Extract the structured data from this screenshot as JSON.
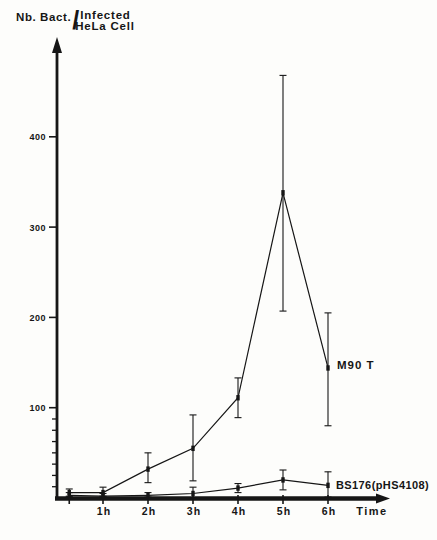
{
  "figure": {
    "background": "#fdfdfb",
    "ink": "#161616",
    "ylabel_parts": {
      "prefix": "Nb. Bact.",
      "slash": "/",
      "line1": "Infected",
      "line2": "HeLa Cell"
    }
  },
  "chart_data": {
    "type": "line",
    "xlabel": "Time",
    "ylabel": "Nb. Bact. / Infected HeLa Cell",
    "xlim": [
      0,
      7.4
    ],
    "ylim": [
      0,
      510
    ],
    "grid": false,
    "legend_position": "labels-at-line-ends",
    "x_ticks": [
      {
        "value": 0.25,
        "label": ""
      },
      {
        "value": 1,
        "label": "1h"
      },
      {
        "value": 2,
        "label": "2h"
      },
      {
        "value": 3,
        "label": "3h"
      },
      {
        "value": 4,
        "label": "4h"
      },
      {
        "value": 5,
        "label": "5h"
      },
      {
        "value": 6,
        "label": "6h"
      }
    ],
    "y_ticks": [
      {
        "value": 100,
        "label": "100"
      },
      {
        "value": 200,
        "label": "200"
      },
      {
        "value": 300,
        "label": "300"
      },
      {
        "value": 400,
        "label": "400"
      }
    ],
    "y_minor_ticks": [
      12.5,
      25,
      37.5,
      50,
      62.5,
      75,
      87.5
    ],
    "series": [
      {
        "name": "M90 T",
        "x": [
          0.25,
          1,
          2,
          3,
          4,
          5,
          6
        ],
        "y": [
          6,
          6,
          32,
          55,
          111,
          338,
          144
        ],
        "err_low": [
          2,
          2,
          17,
          19,
          89,
          207,
          80
        ],
        "err_high": [
          10,
          12,
          50,
          92,
          133,
          468,
          205
        ]
      },
      {
        "name": "BS176(pHS4108)",
        "x": [
          0.25,
          1,
          2,
          3,
          4,
          5,
          6
        ],
        "y": [
          3,
          2,
          3,
          5,
          11,
          20,
          14
        ],
        "err_low": [
          1,
          1,
          1,
          0,
          6,
          9,
          1
        ],
        "err_high": [
          6,
          5,
          6,
          12,
          16,
          31,
          29
        ]
      }
    ]
  }
}
